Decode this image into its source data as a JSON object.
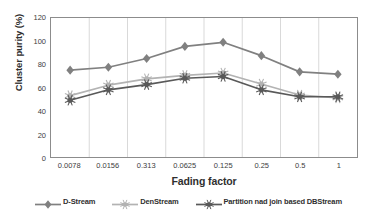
{
  "chart_data": {
    "type": "line",
    "title": "",
    "xlabel": "Fading factor",
    "ylabel": "Cluster purity (%)",
    "categories": [
      "0.0078",
      "0.0156",
      "0.313",
      "0.0625",
      "0.125",
      "0.25",
      "0.5",
      "1"
    ],
    "ylim": [
      0,
      120
    ],
    "yticks": [
      0,
      20,
      40,
      60,
      80,
      100,
      120
    ],
    "grid": "vertical",
    "legend_position": "bottom",
    "series": [
      {
        "name": "D-Stream",
        "color": "#808080",
        "marker": "diamond",
        "values": [
          75,
          77.5,
          85,
          95.5,
          99,
          87.5,
          73.5,
          71.5
        ]
      },
      {
        "name": "DenStream",
        "color": "#b3b3b3",
        "marker": "star",
        "values": [
          53,
          62,
          67.5,
          70.5,
          72.5,
          63,
          53.5,
          51
        ]
      },
      {
        "name": "Partition nad join based DBStream",
        "color": "#595959",
        "marker": "star",
        "values": [
          49,
          58,
          62.5,
          68,
          69.5,
          58,
          52,
          52
        ]
      }
    ]
  },
  "axis": {
    "y_title": "Cluster purity (%)",
    "x_title": "Fading factor",
    "y_tick_labels": [
      "120",
      "100",
      "80",
      "60",
      "40",
      "20",
      "0"
    ],
    "x_tick_labels": [
      "0.0078",
      "0.0156",
      "0.313",
      "0.0625",
      "0.125",
      "0.25",
      "0.5",
      "1"
    ]
  },
  "legend": {
    "items": [
      {
        "label": "D-Stream",
        "color": "#808080"
      },
      {
        "label": "DenStream",
        "color": "#b3b3b3"
      },
      {
        "label": "Partition nad join based DBStream",
        "color": "#595959"
      }
    ]
  }
}
